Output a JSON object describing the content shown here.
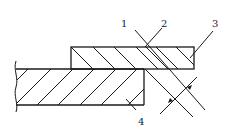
{
  "diagram": {
    "type": "technical-cross-section",
    "labels": [
      {
        "id": "1",
        "text": "1"
      },
      {
        "id": "2",
        "text": "2"
      },
      {
        "id": "3",
        "text": "3"
      },
      {
        "id": "4",
        "text": "4"
      }
    ],
    "colors": {
      "line": "#1a1a1a",
      "background": "#ffffff"
    }
  }
}
